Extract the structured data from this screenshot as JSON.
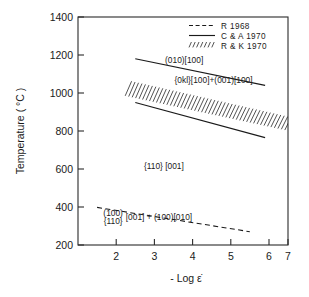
{
  "chart_data": {
    "type": "line",
    "title": "",
    "xlabel": "- Log ε̇",
    "ylabel": "Temperature ( °C )",
    "xlim": [
      1.5,
      7.0
    ],
    "ylim": [
      200,
      1400
    ],
    "xticks": [
      "2",
      "3",
      "4",
      "5",
      "6",
      "7"
    ],
    "xtick_values": [
      2,
      3,
      4,
      5,
      6,
      7
    ],
    "yticks": [
      "200",
      "400",
      "600",
      "800",
      "1000",
      "1200",
      "1400"
    ],
    "ytick_values": [
      200,
      400,
      600,
      800,
      1000,
      1200,
      1400
    ],
    "grid": false,
    "legend_position": "top-right",
    "series": [
      {
        "name": "R 1968",
        "style": "dashed",
        "points": [
          [
            2.0,
            398
          ],
          [
            6.0,
            270
          ]
        ]
      },
      {
        "name": "C & A 1970",
        "style": "solid",
        "points": [
          [
            3.0,
            1180
          ],
          [
            6.4,
            1040
          ]
        ]
      },
      {
        "name": "C & A 1970 lower",
        "style": "solid",
        "points": [
          [
            3.0,
            950
          ],
          [
            6.4,
            765
          ]
        ]
      },
      {
        "name": "R & K 1970",
        "style": "hatched-band",
        "band_upper": [
          [
            2.82,
            1062
          ],
          [
            7.0,
            872
          ]
        ],
        "band_lower": [
          [
            2.82,
            985
          ],
          [
            7.0,
            805
          ]
        ]
      }
    ],
    "annotations": [
      {
        "id": "field-010-100",
        "text": "(010)[100]",
        "x": 4.28,
        "y": 1158
      },
      {
        "id": "field-0kl-100-001-100",
        "text": "{0kl}[100]+(001)[100]",
        "x": 5.05,
        "y": 1053
      },
      {
        "id": "field-110-001",
        "text": "{110}  [001]",
        "x": 3.75,
        "y": 600
      },
      {
        "id": "field-100-110-001",
        "text": "(100)",
        "x": 2.42,
        "y": 352
      },
      {
        "id": "field-100-110-001-b",
        "text": "{110}",
        "x": 2.42,
        "y": 312
      },
      {
        "id": "field-100-010",
        "text": "[001] + (100)[010]",
        "x": 3.62,
        "y": 332
      }
    ]
  },
  "legend": {
    "entries": [
      {
        "label": "R 1968",
        "style": "dashed"
      },
      {
        "label": "C & A 1970",
        "style": "solid"
      },
      {
        "label": "R & K 1970",
        "style": "hatched"
      }
    ]
  },
  "axes": {
    "x_title": "- Log ε̇",
    "y_title": "Temperature ( °C )"
  },
  "colors": {
    "ink": "#1a1a1a",
    "frame": "#2b2b2b",
    "background": "#ffffff"
  }
}
